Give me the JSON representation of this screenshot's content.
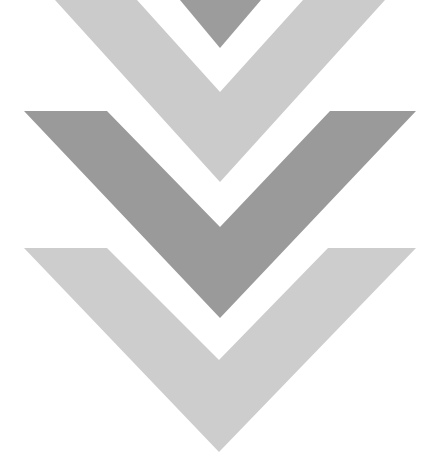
{
  "graphic": {
    "description": "Stacked downward chevron arrows",
    "colors": {
      "light": "#c9c9c9",
      "dark": "#9a9a9a",
      "background": "#ffffff"
    },
    "chevrons": [
      {
        "name": "top-triangle",
        "tone": "dark"
      },
      {
        "name": "top-chevron",
        "tone": "light"
      },
      {
        "name": "middle-chevron",
        "tone": "dark"
      },
      {
        "name": "bottom-chevron",
        "tone": "light"
      }
    ]
  }
}
